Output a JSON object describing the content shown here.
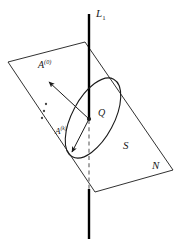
{
  "figure": {
    "kind": "geometry-diagram",
    "background_color": "#ffffff",
    "stroke_color": "#1a1a1a",
    "dash_color": "#8a8a8a",
    "axis_color": "#000000"
  },
  "labels": {
    "line": {
      "base": "L",
      "sub": "1"
    },
    "vector_initial": {
      "base": "A",
      "sup": "(0)"
    },
    "vector_k": {
      "base": "A",
      "sup": "(k)"
    },
    "point": {
      "base": "Q"
    },
    "curve": {
      "base": "S"
    },
    "plane": {
      "base": "N"
    }
  },
  "geometry": {
    "plane_polygon": "8,62 85,42 173,170 95,192",
    "vertical_line": {
      "x": 89,
      "y_top": 14,
      "y_bottom": 239
    },
    "dashed_segment": {
      "x": 89,
      "y_top": 120,
      "y_bottom": 190
    },
    "ellipse": {
      "cx": 93,
      "cy": 118,
      "rx": 44,
      "ry": 21,
      "rotate": -62
    },
    "point_Q": {
      "cx": 89,
      "cy": 119,
      "r": 2.1
    },
    "vector_initial": {
      "x1": 89,
      "y1": 119,
      "x2": 46,
      "y2": 79
    },
    "vector_k": {
      "x1": 89,
      "y1": 119,
      "x2": 70,
      "y2": 156
    },
    "ellipsis_dots": [
      {
        "cx": 46,
        "cy": 105
      },
      {
        "cx": 44,
        "cy": 112
      },
      {
        "cx": 42,
        "cy": 119
      }
    ]
  }
}
